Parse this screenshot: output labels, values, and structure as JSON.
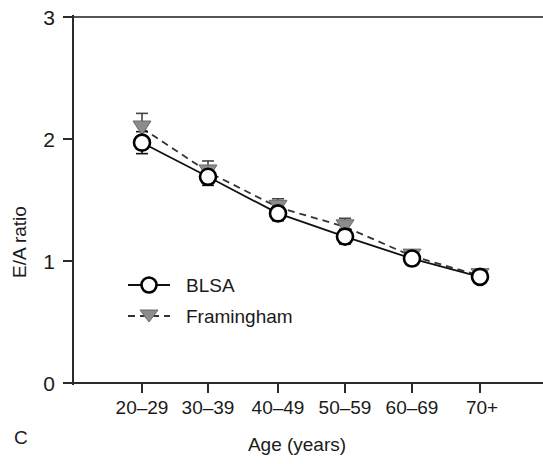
{
  "figure": {
    "panel_label": "C",
    "width": 543,
    "height": 464
  },
  "chart_data": {
    "type": "line",
    "title": "",
    "subtitle": "",
    "xlabel": "Age (years)",
    "ylabel": "E/A ratio",
    "categories": [
      "20–29",
      "30–39",
      "40–49",
      "50–59",
      "60–69",
      "70+"
    ],
    "ylim": [
      0,
      3
    ],
    "yticks": [
      0,
      1,
      2,
      3
    ],
    "ytick_labels": [
      "0",
      "1",
      "2",
      "3"
    ],
    "grid": false,
    "legend_position": "inside-left-lower",
    "series": [
      {
        "name": "BLSA",
        "marker": "open-circle",
        "line_style": "solid",
        "color": "#111111",
        "values": [
          1.97,
          1.69,
          1.39,
          1.2,
          1.02,
          0.87
        ],
        "errors": [
          0.09,
          0.07,
          0.06,
          0.06,
          0.05,
          0.04
        ]
      },
      {
        "name": "Framingham",
        "marker": "filled-triangle-down",
        "line_style": "dashed",
        "color": "#8c8c8c",
        "values": [
          2.09,
          1.73,
          1.44,
          1.28,
          1.04,
          0.88
        ],
        "errors": [
          0.12,
          0.09,
          0.07,
          0.07,
          0.05,
          0.04
        ]
      }
    ]
  },
  "legend": {
    "items": [
      {
        "label": "BLSA",
        "marker": "open-circle",
        "line_style": "solid"
      },
      {
        "label": "Framingham",
        "marker": "filled-triangle-down",
        "line_style": "dashed"
      }
    ]
  },
  "colors": {
    "axis": "#2b2b2b",
    "blsa": "#111111",
    "framingham": "#8c8c8c",
    "background": "#ffffff"
  }
}
